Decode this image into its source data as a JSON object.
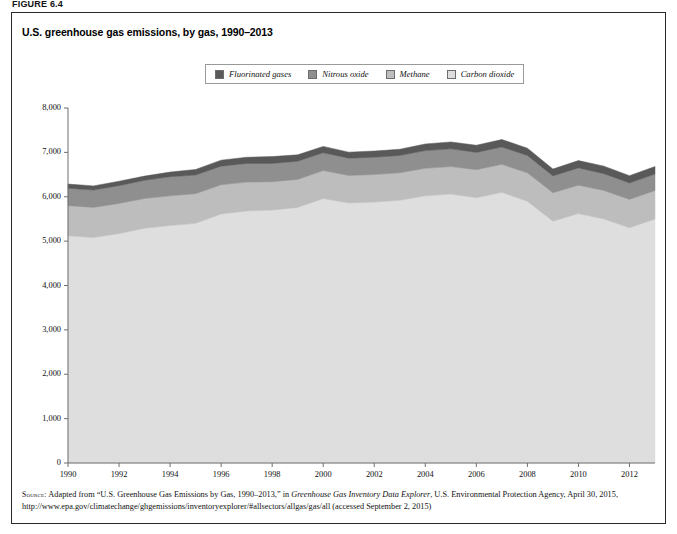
{
  "figure_label": "FIGURE 6.4",
  "title": "U.S. greenhouse gas emissions, by gas, 1990–2013",
  "legend": {
    "items": [
      {
        "label": "Fluorinated gases",
        "color": "#595959"
      },
      {
        "label": "Nitrous oxide",
        "color": "#8f8f8f"
      },
      {
        "label": "Methane",
        "color": "#bdbdbd"
      },
      {
        "label": "Carbon dioxide",
        "color": "#dedede"
      }
    ]
  },
  "source": {
    "tag": "Source:",
    "line1_a": " Adapted from “U.S. Greenhouse Gas Emissions by Gas, 1990–2013,” in ",
    "line1_ital": "Greenhouse Gas Inventory Data Explorer",
    "line1_b": ", U.S. Environmental Protection Agency, April 30, 2015, http://www.epa.gov/climatechange/ghgemissions/inventoryexplorer/#allsectors/allgas/gas/all (accessed September 2, 2015)"
  },
  "chart_data": {
    "type": "area",
    "stacked": true,
    "title": "U.S. greenhouse gas emissions, by gas, 1990–2013",
    "xlabel": "",
    "ylabel": "Million metric tons of carbon dioxide equivalent",
    "xlim": [
      1990,
      2013
    ],
    "ylim": [
      0,
      8000
    ],
    "ytick_labels": [
      "0",
      "1,000",
      "2,000",
      "3,000",
      "4,000",
      "5,000",
      "6,000",
      "7,000",
      "8,000"
    ],
    "yticks": [
      0,
      1000,
      2000,
      3000,
      4000,
      5000,
      6000,
      7000,
      8000
    ],
    "xtick_labels": [
      "1990",
      "1992",
      "1994",
      "1996",
      "1998",
      "2000",
      "2002",
      "2004",
      "2006",
      "2008",
      "2010",
      "2012"
    ],
    "xticks": [
      1990,
      1992,
      1994,
      1996,
      1998,
      2000,
      2002,
      2004,
      2006,
      2008,
      2010,
      2012
    ],
    "grid": false,
    "legend_position": "top-center",
    "x": [
      1990,
      1991,
      1992,
      1993,
      1994,
      1995,
      1996,
      1997,
      1998,
      1999,
      2000,
      2001,
      2002,
      2003,
      2004,
      2005,
      2006,
      2007,
      2008,
      2009,
      2010,
      2011,
      2012,
      2013
    ],
    "series": [
      {
        "name": "Carbon dioxide",
        "color": "#dedede",
        "values": [
          5120,
          5080,
          5170,
          5290,
          5350,
          5400,
          5610,
          5680,
          5700,
          5760,
          5960,
          5860,
          5880,
          5920,
          6020,
          6060,
          5980,
          6100,
          5900,
          5450,
          5620,
          5500,
          5300,
          5500
        ]
      },
      {
        "name": "Methane",
        "color": "#bdbdbd",
        "values": [
          680,
          680,
          680,
          670,
          670,
          670,
          660,
          650,
          640,
          630,
          630,
          620,
          620,
          620,
          620,
          620,
          630,
          630,
          640,
          640,
          640,
          640,
          640,
          640
        ]
      },
      {
        "name": "Nitrous oxide",
        "color": "#8f8f8f",
        "values": [
          390,
          390,
          400,
          410,
          430,
          420,
          420,
          420,
          410,
          410,
          400,
          390,
          390,
          390,
          400,
          400,
          390,
          390,
          390,
          380,
          390,
          380,
          370,
          370
        ]
      },
      {
        "name": "Fluorinated gases",
        "color": "#595959",
        "values": [
          95,
          95,
          100,
          95,
          105,
          125,
          135,
          140,
          155,
          145,
          145,
          135,
          140,
          140,
          150,
          155,
          160,
          170,
          165,
          155,
          165,
          170,
          165,
          170
        ]
      }
    ],
    "totals": [
      6285,
      6245,
      6350,
      6465,
      6555,
      6615,
      6825,
      6890,
      6905,
      6945,
      7135,
      7005,
      7030,
      7070,
      7190,
      7235,
      7160,
      7290,
      7095,
      6625,
      6815,
      6690,
      6475,
      6680
    ]
  }
}
